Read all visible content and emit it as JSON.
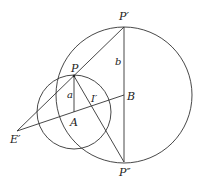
{
  "diagram": {
    "labels": {
      "p_prime": "P′",
      "p_double_prime": "P″",
      "p": "P",
      "a_point": "A",
      "b_point": "B",
      "e_prime": "E′",
      "i_prime": "I′",
      "a_len": "a",
      "b_len": "b"
    },
    "points": {
      "P_prime": [
        124,
        27
      ],
      "P_double_prime": [
        124,
        162
      ],
      "B": [
        124,
        95
      ],
      "P": [
        74,
        76
      ],
      "A": [
        74,
        112
      ],
      "E_prime": [
        17,
        131
      ],
      "I_prime": [
        93,
        101
      ]
    },
    "circles": {
      "large": {
        "cx": 124,
        "cy": 95,
        "r": 68
      },
      "small": {
        "cx": 74,
        "cy": 112,
        "r": 37
      }
    },
    "line_color": "#333333"
  }
}
